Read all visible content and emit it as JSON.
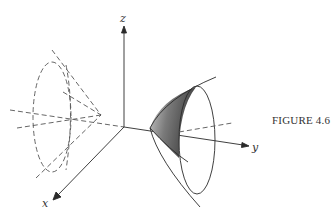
{
  "figure": {
    "caption": "FIGURE 4.6",
    "axes": {
      "x_label": "x",
      "y_label": "y",
      "z_label": "z"
    },
    "elements": [
      {
        "name": "dashed-cone",
        "style": "dashed",
        "description": "cone with apex on negative y-axis, opening toward -y"
      },
      {
        "name": "solid-paraboloid",
        "style": "solid",
        "description": "cone/surface along positive y-axis with shaded section"
      },
      {
        "name": "shaded-region",
        "fill": "#5a5a5a"
      }
    ],
    "colors": {
      "line": "#2a2a2a",
      "dashed": "#555555",
      "shade_dark": "#4a4a4a",
      "shade_light": "#bdbdbd"
    }
  }
}
